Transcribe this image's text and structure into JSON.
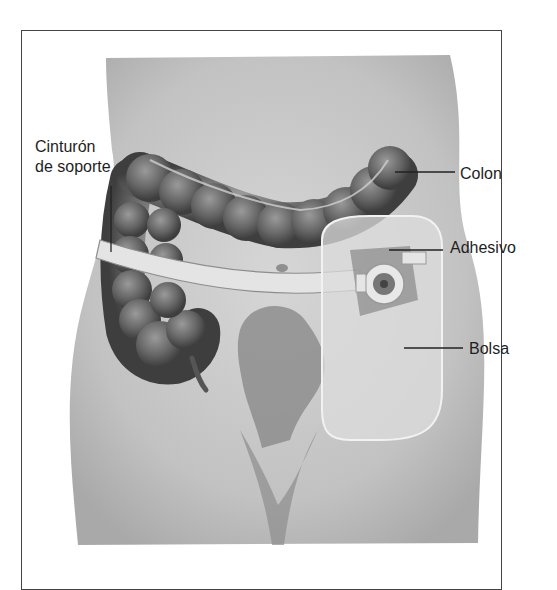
{
  "figure": {
    "labels": {
      "belt_line1": "Cinturón",
      "belt_line2": "de soporte",
      "colon": "Colon",
      "adhesive": "Adhesivo",
      "pouch": "Bolsa"
    },
    "colors": {
      "skin": "#c9c9c9",
      "skin_dark": "#9a9a9a",
      "colon": "#6e6e6e",
      "colon_dark": "#444444",
      "belt": "#e2e2e2",
      "pouch": "#d8d8d8",
      "frame": "#444444"
    }
  }
}
